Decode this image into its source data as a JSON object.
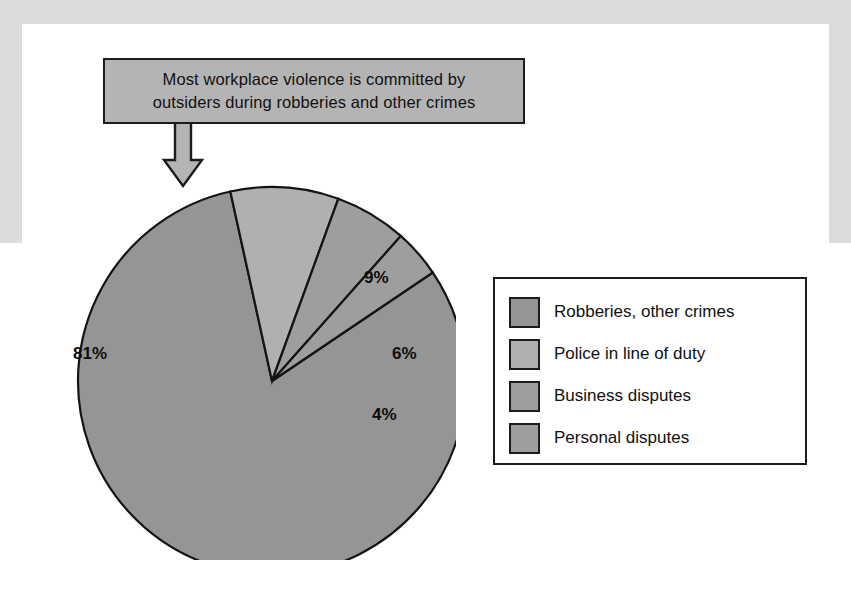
{
  "callout": {
    "text": "Most workplace violence is committed by outsiders during robberies and other crimes",
    "line1": "Most workplace violence is committed by",
    "line2": "outsiders during robberies and other crimes",
    "fill": "#b4b4b4",
    "border": "#1c1c1c",
    "arrow": "down-arrow"
  },
  "legend": {
    "items": [
      {
        "label": "Robberies, other crimes",
        "color": "#959595"
      },
      {
        "label": "Police in line of duty",
        "color": "#b0b0b0"
      },
      {
        "label": "Business disputes",
        "color": "#9e9e9e"
      },
      {
        "label": "Personal disputes",
        "color": "#9e9e9e"
      }
    ]
  },
  "chart_data": {
    "type": "pie",
    "title": "",
    "labels": [
      "Robberies, other crimes",
      "Police in line of duty",
      "Business disputes",
      "Personal disputes"
    ],
    "values": [
      81,
      9,
      6,
      4
    ],
    "value_labels": [
      "81%",
      "9%",
      "6%",
      "4%"
    ],
    "unit": "percent",
    "colors": [
      "#959595",
      "#b0b0b0",
      "#9e9e9e",
      "#9e9e9e"
    ],
    "stroke": "#141414",
    "start_angle_deg": -34,
    "direction": "clockwise",
    "legend_position": "right",
    "grid": false,
    "annotations": [
      "Most workplace violence is committed by outsiders during robberies and other crimes"
    ]
  }
}
